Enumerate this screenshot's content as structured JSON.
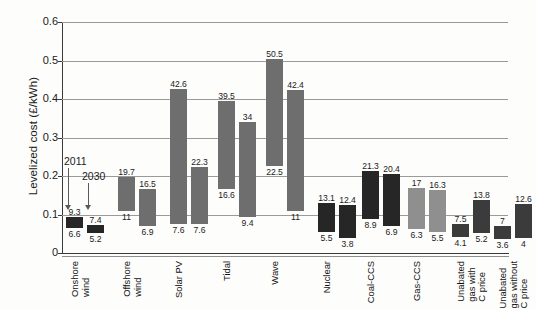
{
  "chart_data": {
    "type": "bar",
    "title": "",
    "xlabel": "",
    "ylabel": "Levelized cost (£/kWh)",
    "ylim": [
      0,
      0.6
    ],
    "yticks": [
      "0",
      "0.1",
      "0.2",
      "0.3",
      "0.4",
      "0.5",
      "0.6"
    ],
    "ytick_values": [
      0,
      0.1,
      0.2,
      0.3,
      0.4,
      0.5,
      0.6
    ],
    "grid": true,
    "legend_position": "none",
    "value_unit": "pence per kWh (p/kWh)",
    "note": "Each category shows two floating range bars: left bar = 2011, right bar = 2030. Labels above each bar are the range maximum, labels below are the range minimum.",
    "annotations": [
      {
        "text": "2011",
        "points_to": "Onshore wind 2011 bar"
      },
      {
        "text": "2030",
        "points_to": "Onshore wind 2030 bar"
      }
    ],
    "categories": [
      "Onshore wind",
      "Offshore wind",
      "Solar PV",
      "Tidal",
      "Wave",
      "Nuclear",
      "Coal-CCS",
      "Gas-CCS",
      "Unabated gas with C price",
      "Unabated gas without C price"
    ],
    "series": [
      {
        "name": "2011",
        "low": [
          6.6,
          11,
          7.6,
          16.6,
          22.5,
          5.5,
          8.9,
          6.3,
          4.1,
          3.6
        ],
        "high": [
          9.3,
          19.7,
          42.6,
          39.5,
          50.5,
          13.1,
          21.3,
          17,
          7.5,
          7
        ]
      },
      {
        "name": "2030",
        "low": [
          5.2,
          6.9,
          7.6,
          9.4,
          11,
          3.8,
          6.9,
          5.5,
          5.2,
          4
        ],
        "high": [
          7.4,
          16.5,
          22.3,
          34,
          42.4,
          12.4,
          20.4,
          16.3,
          13.8,
          12.6
        ]
      }
    ],
    "group_colors": {
      "Onshore wind": "#262626",
      "Offshore wind": "#6e6e6e",
      "Solar PV": "#6e6e6e",
      "Tidal": "#6e6e6e",
      "Wave": "#6e6e6e",
      "Nuclear": "#262626",
      "Coal-CCS": "#262626",
      "Gas-CCS": "#8f8f8f",
      "Unabated gas with C price": "#3b3b3b",
      "Unabated gas without C price": "#3b3b3b"
    }
  },
  "colors": {
    "background": "#fdfdfc",
    "axis": "#3a3a3a",
    "gridline": "#9a9a9a",
    "text": "#1b1b1b",
    "renewable_bar": "#6e6e6e",
    "dark_bar": "#262626",
    "mid_bar": "#8f8f8f"
  }
}
